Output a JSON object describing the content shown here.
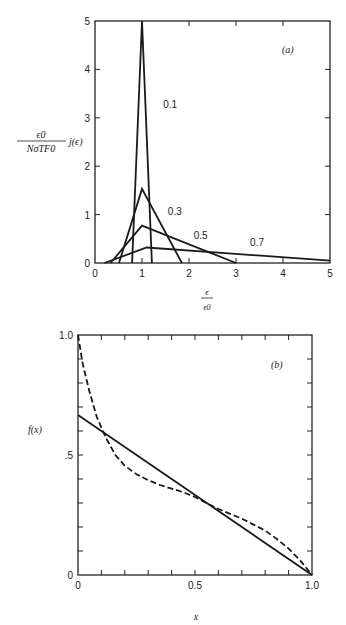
{
  "chart_data": [
    {
      "id": "a",
      "type": "line",
      "panel_label": "(a)",
      "title": "",
      "xlabel": {
        "numerator": "ϵ",
        "denominator": "ϵ0"
      },
      "ylabel": {
        "numerator": "ϵ0",
        "denominator": "NσTF0",
        "suffix": "j(ϵ)"
      },
      "xlim": [
        0,
        5
      ],
      "ylim": [
        0,
        5
      ],
      "xticks": [
        0,
        1,
        2,
        3,
        4,
        5
      ],
      "xtick_labels": [
        "0",
        "1",
        "2",
        "3",
        "4",
        "5"
      ],
      "yticks": [
        0,
        1,
        2,
        3,
        4,
        5
      ],
      "ytick_labels": [
        "0",
        "1",
        "2",
        "3",
        "4",
        "5"
      ],
      "grid": false,
      "series": [
        {
          "name": "0.1",
          "label_at": [
            1.45,
            3.2
          ],
          "x": [
            0.79,
            1.0,
            1.21
          ],
          "y": [
            0,
            5.0,
            0
          ]
        },
        {
          "name": "0.3",
          "label_at": [
            1.55,
            1.0
          ],
          "x": [
            0.51,
            1.0,
            1.85
          ],
          "y": [
            0,
            1.53,
            0
          ]
        },
        {
          "name": "0.5",
          "label_at": [
            2.1,
            0.5
          ],
          "x": [
            0.33,
            1.0,
            3.0
          ],
          "y": [
            0,
            0.77,
            0
          ]
        },
        {
          "name": "0.7",
          "label_at": [
            3.3,
            0.35
          ],
          "x": [
            0.2,
            1.1,
            5.0
          ],
          "y": [
            0,
            0.32,
            0.05
          ]
        }
      ]
    },
    {
      "id": "b",
      "type": "line",
      "panel_label": "(b)",
      "title": "",
      "xlabel": "x",
      "ylabel": "f(x)",
      "xlim": [
        0,
        1.0
      ],
      "ylim": [
        0,
        1.0
      ],
      "xticks": [
        0,
        0.5,
        1.0
      ],
      "xtick_labels": [
        "0",
        "0.5",
        "1.0"
      ],
      "yticks": [
        0,
        0.5,
        1.0
      ],
      "ytick_labels": [
        "0",
        ".5",
        "1.0"
      ],
      "minor_tick_step": 0.1,
      "grid": false,
      "series": [
        {
          "name": "solid",
          "style": "solid",
          "x": [
            0,
            1.0
          ],
          "y": [
            0.667,
            0
          ]
        },
        {
          "name": "dashed",
          "style": "dashed",
          "x": [
            0,
            0.02,
            0.05,
            0.08,
            0.12,
            0.16,
            0.2,
            0.25,
            0.3,
            0.35,
            0.4,
            0.45,
            0.5,
            0.55,
            0.6,
            0.65,
            0.7,
            0.75,
            0.8,
            0.85,
            0.9,
            0.95,
            1.0
          ],
          "y": [
            1.0,
            0.88,
            0.76,
            0.66,
            0.57,
            0.5,
            0.455,
            0.42,
            0.395,
            0.375,
            0.36,
            0.345,
            0.325,
            0.3,
            0.275,
            0.255,
            0.235,
            0.21,
            0.185,
            0.15,
            0.11,
            0.06,
            0.0
          ]
        }
      ]
    }
  ]
}
